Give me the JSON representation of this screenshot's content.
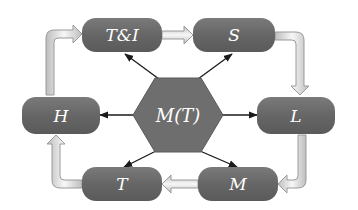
{
  "diagram": {
    "hub": {
      "label": "M(T)"
    },
    "nodes": [
      {
        "id": "ti",
        "label": "T&I"
      },
      {
        "id": "s",
        "label": "S"
      },
      {
        "id": "l",
        "label": "L"
      },
      {
        "id": "m",
        "label": "M"
      },
      {
        "id": "t",
        "label": "T"
      },
      {
        "id": "h",
        "label": "H"
      }
    ],
    "cycle_order": [
      "T&I",
      "S",
      "L",
      "M",
      "T",
      "H",
      "T&I"
    ],
    "hub_arrows_to": [
      "T&I",
      "S",
      "L",
      "M",
      "T",
      "H"
    ],
    "colors": {
      "node_fill": "#6b6b6b",
      "node_fill_light": "#8a8a8a",
      "hub_fill": "#6e6e6e",
      "arrow_line": "#1a1a1a",
      "flow_arrow_fill": "#f2f2f2",
      "flow_arrow_stroke": "#9a9a9a"
    }
  }
}
